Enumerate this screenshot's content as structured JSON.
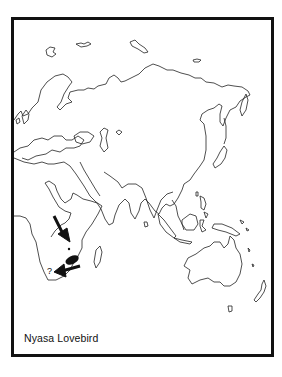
{
  "map": {
    "title": "Nyasa Lovebird",
    "region": "Eastern Hemisphere (Europe, Africa, Asia, Australia)",
    "range_markers": {
      "main_range_arrow": "points to range patch in south-central Africa",
      "secondary_arrow": "points to small uncertain area in southern Africa",
      "uncertain_label": "?"
    },
    "colors": {
      "frame": "#111111",
      "outline": "#222222",
      "range_fill": "#111111",
      "background": "#ffffff"
    }
  }
}
